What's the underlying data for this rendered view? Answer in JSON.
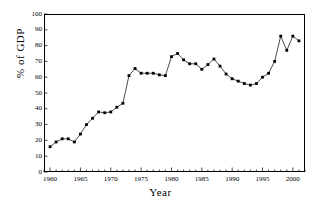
{
  "chart_data": {
    "type": "line",
    "title": "",
    "xlabel": "Year",
    "ylabel": "% of GDP",
    "xlim": [
      1959,
      2002
    ],
    "ylim": [
      0,
      100
    ],
    "grid": false,
    "legend": null,
    "marker": "filled-square",
    "line_color": "#000000",
    "x": [
      1960,
      1961,
      1962,
      1963,
      1964,
      1965,
      1966,
      1967,
      1968,
      1969,
      1970,
      1971,
      1972,
      1973,
      1974,
      1975,
      1976,
      1977,
      1978,
      1979,
      1980,
      1981,
      1982,
      1983,
      1984,
      1985,
      1986,
      1987,
      1988,
      1989,
      1990,
      1991,
      1992,
      1993,
      1994,
      1995,
      1996,
      1997,
      1998,
      1999,
      2000,
      2001
    ],
    "values": [
      16,
      19,
      21,
      21,
      19,
      24,
      30,
      34,
      38,
      37.5,
      38,
      41,
      43.5,
      61,
      65.5,
      62.5,
      62.5,
      62.5,
      61.5,
      61,
      73,
      75,
      71,
      68.5,
      68.5,
      65,
      68,
      71.5,
      67,
      62,
      59,
      57.5,
      56,
      55,
      56,
      60,
      62.5,
      70,
      86,
      77,
      86,
      83
    ],
    "xticks": [
      1960,
      1965,
      1970,
      1975,
      1980,
      1985,
      1990,
      1995,
      2000
    ],
    "xticklabels": [
      "1960",
      "1965",
      "1970",
      "1975",
      "1980",
      "1985",
      "1990",
      "1995",
      "2000"
    ],
    "xminortick_step": 1,
    "yticks": [
      0,
      10,
      20,
      30,
      40,
      50,
      60,
      70,
      80,
      90,
      100
    ],
    "yticklabels": [
      "0",
      "10",
      "20",
      "30",
      "40",
      "50",
      "60",
      "70",
      "80",
      "90",
      "100"
    ]
  }
}
